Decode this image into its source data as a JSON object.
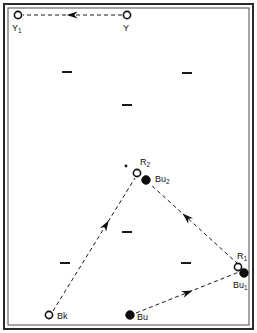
{
  "figure": {
    "background_color": "#ffffff",
    "ink_color": "#0d0d0d",
    "frame": {
      "outer_stroke": "#2a2a2a",
      "inner_stroke": "#4a4a4a"
    }
  },
  "nodes": [
    {
      "id": "Y1",
      "label_main": "Y",
      "label_sub": "1",
      "marker": "open-circle",
      "x": 18,
      "y": 15,
      "r": 3.6,
      "label_x": 12,
      "label_y": 31
    },
    {
      "id": "Y",
      "label_main": "Y",
      "label_sub": "",
      "marker": "open-circle",
      "x": 127,
      "y": 15,
      "r": 3.6,
      "label_x": 123,
      "label_y": 31
    },
    {
      "id": "R2",
      "label_main": "R",
      "label_sub": "2",
      "marker": "open-circle",
      "x": 137,
      "y": 173,
      "r": 3.6,
      "label_x": 140,
      "label_y": 165
    },
    {
      "id": "Bu2",
      "label_main": "Bu",
      "label_sub": "2",
      "marker": "filled-circle",
      "x": 146,
      "y": 180,
      "r": 4.4,
      "label_x": 155,
      "label_y": 182
    },
    {
      "id": "R1",
      "label_main": "R",
      "label_sub": "1",
      "marker": "open-circle",
      "x": 238,
      "y": 267,
      "r": 3.6,
      "label_x": 237,
      "label_y": 259
    },
    {
      "id": "Bu1",
      "label_main": "Bu",
      "label_sub": "1",
      "marker": "filled-circle",
      "x": 244,
      "y": 273,
      "r": 4.4,
      "label_x": 233,
      "label_y": 288
    },
    {
      "id": "Bk",
      "label_main": "Bk",
      "label_sub": "",
      "marker": "open-circle",
      "x": 49,
      "y": 315,
      "r": 3.6,
      "label_x": 57,
      "label_y": 319
    },
    {
      "id": "Bu",
      "label_main": "Bu",
      "label_sub": "",
      "marker": "filled-circle",
      "x": 130,
      "y": 315,
      "r": 4.4,
      "label_x": 137,
      "label_y": 320
    }
  ],
  "stray_dot": {
    "name": "small-dot",
    "x": 126,
    "y": 166,
    "r": 1.4
  },
  "vectors": [
    {
      "id": "Y-to-Y1",
      "from": "Y",
      "to": "Y1",
      "x1": 122,
      "y1": 15,
      "x2": 23,
      "y2": 15,
      "arrow_t": 0.56,
      "direction": "left"
    },
    {
      "id": "Bk-to-R2",
      "from": "Bk",
      "to": "R2",
      "x1": 53,
      "y1": 311,
      "x2": 135,
      "y2": 178,
      "arrow_t": 0.68,
      "direction": "up-right"
    },
    {
      "id": "Bu1-to-Bu2",
      "from": "Bu1",
      "to": "Bu2",
      "x1": 238,
      "y1": 264,
      "x2": 150,
      "y2": 184,
      "arrow_t": 0.63,
      "direction": "up-left"
    },
    {
      "id": "Bu-to-Bu1",
      "from": "Bu",
      "to": "Bu1",
      "x1": 136,
      "y1": 313,
      "x2": 239,
      "y2": 272,
      "arrow_t": 0.55,
      "direction": "up-right"
    }
  ],
  "tick_dashes": [
    {
      "id": "dash-upper-left",
      "x": 62,
      "y": 71,
      "w": 10,
      "h": 2
    },
    {
      "id": "dash-upper-right",
      "x": 182,
      "y": 72,
      "w": 10,
      "h": 2
    },
    {
      "id": "dash-upper-center",
      "x": 122,
      "y": 104,
      "w": 10,
      "h": 2
    },
    {
      "id": "dash-lower-center",
      "x": 122,
      "y": 231,
      "w": 10,
      "h": 2
    },
    {
      "id": "dash-lower-left",
      "x": 60,
      "y": 262,
      "w": 10,
      "h": 2
    },
    {
      "id": "dash-lower-right",
      "x": 181,
      "y": 262,
      "w": 10,
      "h": 2
    }
  ]
}
